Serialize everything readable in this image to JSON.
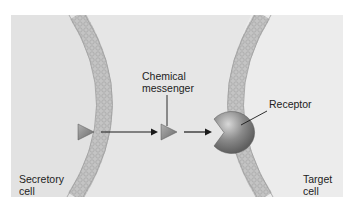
{
  "diagram": {
    "type": "cell-signaling",
    "labels": {
      "messenger_line1": "Chemical",
      "messenger_line2": "messenger",
      "receptor": "Receptor",
      "secretory_line1": "Secretory",
      "secretory_line2": "cell",
      "target_line1": "Target",
      "target_line2": "cell"
    },
    "colors": {
      "background": "#e6e6e6",
      "membrane": "#b8b8b8",
      "messenger": "#8a8a8a",
      "receptor": "#7c7c7c",
      "arrow": "#1a1a1a",
      "text": "#222222"
    },
    "elements": [
      {
        "name": "secretory-cell-membrane"
      },
      {
        "name": "target-cell-membrane"
      },
      {
        "name": "chemical-messenger",
        "count": 2
      },
      {
        "name": "receptor"
      },
      {
        "name": "arrow",
        "count": 2
      }
    ]
  }
}
